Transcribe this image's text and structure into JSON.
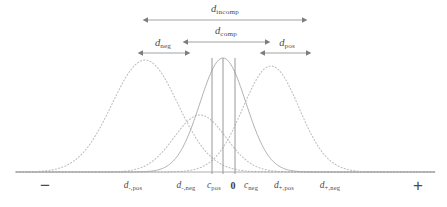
{
  "figure": {
    "width": 447,
    "height": 207,
    "background": "#ffffff",
    "baseline_y": 172,
    "axis_color": "#9a9a9a",
    "curve_color_solid": "#a9a9a9",
    "curve_color_dotted": "#bdbdbd",
    "vline_color": "#8c8c8c",
    "arrow_color": "#8a8a8a",
    "text_color": "#4a4a4a"
  },
  "chart_data": {
    "type": "line",
    "title": "",
    "xlabel": "",
    "ylabel": "",
    "grid": false,
    "legend": "none",
    "xlim": [
      0,
      447
    ],
    "ylim": [
      0,
      207
    ],
    "curves": [
      {
        "name": "d_-,pos",
        "style": "dotted",
        "center_x": 145,
        "peak_y": 60,
        "sigma": 33,
        "color": "#bdbdbd"
      },
      {
        "name": "d_-,neg",
        "style": "dotted",
        "center_x": 200,
        "peak_y": 115,
        "sigma": 26,
        "color": "#bdbdbd"
      },
      {
        "name": "d_+,pos",
        "style": "solid",
        "center_x": 223,
        "peak_y": 58,
        "sigma": 23,
        "color": "#a9a9a9"
      },
      {
        "name": "d_+,neg",
        "style": "dotted",
        "center_x": 271,
        "peak_y": 66,
        "sigma": 28,
        "color": "#bdbdbd"
      }
    ],
    "vertical_lines": [
      {
        "label": "c_pos",
        "x": 212
      },
      {
        "label": "0",
        "x": 223
      },
      {
        "label": "c_neg",
        "x": 235
      }
    ],
    "intervals": [
      {
        "id": "d_incomp",
        "x_start": 148,
        "x_end": 302,
        "y": 20,
        "label_y": 9
      },
      {
        "id": "d_comp",
        "x_start": 188,
        "x_end": 265,
        "y": 42,
        "label_y": 31
      },
      {
        "id": "d_neg",
        "x_start": 143,
        "x_end": 185,
        "y": 53,
        "label_y": 43
      },
      {
        "id": "d_pos",
        "x_start": 265,
        "x_end": 306,
        "y": 53,
        "label_y": 43
      }
    ]
  },
  "arrow_labels": [
    {
      "name": "d-incomp-label",
      "base": "d",
      "sub": "incomp",
      "x": 225,
      "y": 9
    },
    {
      "name": "d-comp-label",
      "base": "d",
      "sub": "comp",
      "x": 226,
      "y": 31
    },
    {
      "name": "d-neg-label",
      "base": "d",
      "sub": "neg",
      "x": 163,
      "y": 43
    },
    {
      "name": "d-pos-label",
      "base": "d",
      "sub": "pos",
      "x": 287,
      "y": 43
    }
  ],
  "axis_labels": [
    {
      "name": "d-minus-pos-label",
      "base": "d",
      "sub": "-,pos",
      "x": 133,
      "y": 186,
      "bold": false
    },
    {
      "name": "d-minus-neg-label",
      "base": "d",
      "sub": "-,neg",
      "x": 186,
      "y": 186,
      "bold": false
    },
    {
      "name": "c-pos-label",
      "base": "c",
      "sub": "pos",
      "x": 214,
      "y": 186,
      "bold": false
    },
    {
      "name": "zero-label",
      "base": "0",
      "sub": "",
      "x": 233,
      "y": 186,
      "bold": true
    },
    {
      "name": "c-neg-label",
      "base": "c",
      "sub": "neg",
      "x": 251,
      "y": 186,
      "bold": false
    },
    {
      "name": "d-plus-pos-label",
      "base": "d",
      "sub": "+,pos",
      "x": 284,
      "y": 186,
      "bold": false
    },
    {
      "name": "d-plus-neg-label",
      "base": "d",
      "sub": "+,neg",
      "x": 330,
      "y": 186,
      "bold": false
    }
  ],
  "sign_labels": [
    {
      "name": "minus-sign-label",
      "text": "−",
      "x": 45,
      "y": 185
    },
    {
      "name": "plus-sign-label",
      "text": "+",
      "x": 418,
      "y": 185
    }
  ]
}
